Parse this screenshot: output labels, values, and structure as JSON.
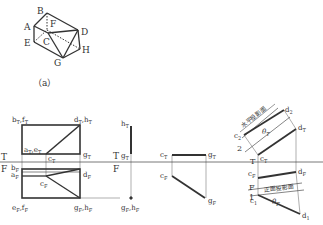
{
  "figure_a": {
    "caption": "（a）",
    "vertices": {
      "A": "A",
      "B": "B",
      "C": "C",
      "D": "D",
      "E": "E",
      "F": "F",
      "G": "G",
      "H": "H"
    }
  },
  "views": {
    "front_top": {
      "top_labels": {
        "bf": "b",
        "bf_sub": "T",
        "bf2": ",f",
        "bf2_sub": "T",
        "dh": "d",
        "dh_sub": "T",
        "dh2": ",h",
        "dh2_sub": "T",
        "ae": "a",
        "ae_sub": "T",
        "ae2": ",e",
        "ae2_sub": "T",
        "g": "g",
        "g_sub": "T",
        "c": "c",
        "c_sub": "T"
      },
      "front_labels": {
        "b": "b",
        "b_sub": "F",
        "a": "a",
        "a_sub": "F",
        "c": "c",
        "c_sub": "F",
        "d": "d",
        "d_sub": "F",
        "ef": "e",
        "ef_sub": "F",
        "ef2": ",f",
        "ef2_sub": "F",
        "gh": "g",
        "gh_sub": "F",
        "gh2": ",h",
        "gh2_sub": "F"
      },
      "axis": {
        "T": "T",
        "F": "F"
      }
    },
    "gh_view": {
      "labels": {
        "h": "h",
        "h_sub": "T",
        "g": "g",
        "g_sub": "T",
        "gf": "g",
        "gf_sub": "F",
        "hf": ",h",
        "hf_sub": "F"
      },
      "axis": {
        "T": "T",
        "F": "F"
      }
    },
    "cg_view": {
      "labels": {
        "cT": "c",
        "cT_sub": "T",
        "gT": "g",
        "gT_sub": "T",
        "cF": "c",
        "cF_sub": "F",
        "gF": "g",
        "gF_sub": "F"
      }
    },
    "cd_view": {
      "labels": {
        "c2": "c",
        "c2_sub": "2",
        "d2": "d",
        "d2_sub": "2",
        "dT": "d",
        "dT_sub": "T",
        "cT": "c",
        "cT_sub": "T",
        "cF": "c",
        "cF_sub": "F",
        "dF": "d",
        "dF_sub": "F",
        "c1": "c",
        "c1_sub": "1",
        "d1": "d",
        "d1_sub": "1",
        "theta_T": "θ",
        "theta_T_sub": "T",
        "theta_F": "θ",
        "theta_F_sub": "F",
        "axis_T": "T",
        "axis_F": "F",
        "num2": "2",
        "num1": "1",
        "horizontal_plane": "水平投影面",
        "frontal_plane": "正面投影面"
      }
    }
  }
}
